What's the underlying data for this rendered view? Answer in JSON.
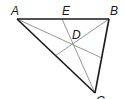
{
  "diagram": {
    "colors": {
      "triangle_stroke": "#1a1a1a",
      "cevian_stroke": "#8a8a8a",
      "label": "#1a1a1a",
      "background": "#ffffff"
    },
    "points": {
      "A": {
        "label": "A",
        "x": 17,
        "y": 19
      },
      "B": {
        "label": "B",
        "x": 109,
        "y": 19
      },
      "C": {
        "label": "C",
        "x": 95,
        "y": 93
      },
      "D": {
        "label": "D",
        "x": 73,
        "y": 45
      },
      "E": {
        "label": "E",
        "x": 62,
        "y": 19
      },
      "F": {
        "x": 102,
        "y": 58
      },
      "G": {
        "x": 55,
        "y": 56
      }
    },
    "labels": {
      "A": "A",
      "B": "B",
      "C": "C",
      "D": "D",
      "E": "E"
    },
    "segments": {
      "triangle": [
        "AB",
        "BC",
        "CA"
      ],
      "cevians": [
        "AF",
        "BG",
        "EC"
      ]
    }
  }
}
